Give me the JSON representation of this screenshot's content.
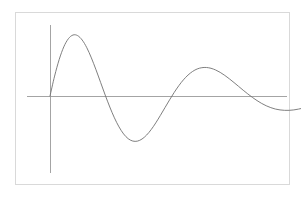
{
  "figure": {
    "width": 301,
    "height": 199,
    "background_color": "#ffffff",
    "border_color": "#d9d9d9",
    "border_rect": {
      "x": 15,
      "y": 12,
      "width": 275,
      "height": 173
    }
  },
  "chart_data": {
    "type": "line",
    "title": "",
    "subtitle": "",
    "xlabel": "",
    "ylabel": "",
    "grid": false,
    "legend": null,
    "series": [
      {
        "name": "damped oscillation",
        "color": "#707070",
        "line_width": 0.9,
        "function": "y = A * exp(-k*x) * sin(2*pi*x/T)",
        "amplitude": 1.0,
        "decay_constant": 0.42,
        "period": 2.0,
        "x_start": 0.0,
        "x_end": 6.95,
        "points": [
          [
            0.0,
            0.0
          ],
          [
            0.1,
            0.296
          ],
          [
            0.2,
            0.543
          ],
          [
            0.3,
            0.731
          ],
          [
            0.4,
            0.852
          ],
          [
            0.5,
            0.907
          ],
          [
            0.6,
            0.898
          ],
          [
            0.7,
            0.832
          ],
          [
            0.8,
            0.718
          ],
          [
            0.9,
            0.566
          ],
          [
            1.0,
            0.39
          ],
          [
            1.1,
            0.202
          ],
          [
            1.2,
            0.014
          ],
          [
            1.3,
            -0.164
          ],
          [
            1.4,
            -0.324
          ],
          [
            1.5,
            -0.459
          ],
          [
            1.6,
            -0.564
          ],
          [
            1.7,
            -0.635
          ],
          [
            1.8,
            -0.67
          ],
          [
            1.9,
            -0.671
          ],
          [
            2.0,
            -0.64
          ],
          [
            2.1,
            -0.581
          ],
          [
            2.2,
            -0.499
          ],
          [
            2.3,
            -0.399
          ],
          [
            2.4,
            -0.288
          ],
          [
            2.5,
            -0.172
          ],
          [
            2.6,
            -0.057
          ],
          [
            2.7,
            0.053
          ],
          [
            2.8,
            0.153
          ],
          [
            2.9,
            0.24
          ],
          [
            3.0,
            0.311
          ],
          [
            3.1,
            0.365
          ],
          [
            3.2,
            0.402
          ],
          [
            3.3,
            0.421
          ],
          [
            3.4,
            0.424
          ],
          [
            3.5,
            0.412
          ],
          [
            3.6,
            0.387
          ],
          [
            3.7,
            0.351
          ],
          [
            3.8,
            0.306
          ],
          [
            3.9,
            0.255
          ],
          [
            4.0,
            0.2
          ],
          [
            4.1,
            0.143
          ],
          [
            4.2,
            0.086
          ],
          [
            4.3,
            0.031
          ],
          [
            4.4,
            -0.021
          ],
          [
            4.5,
            -0.068
          ],
          [
            4.6,
            -0.11
          ],
          [
            4.7,
            -0.145
          ],
          [
            4.8,
            -0.173
          ],
          [
            4.9,
            -0.194
          ],
          [
            5.0,
            -0.207
          ],
          [
            5.1,
            -0.213
          ],
          [
            5.2,
            -0.213
          ],
          [
            5.3,
            -0.207
          ],
          [
            5.4,
            -0.195
          ],
          [
            5.5,
            -0.18
          ],
          [
            5.6,
            -0.161
          ],
          [
            5.7,
            -0.139
          ],
          [
            5.8,
            -0.116
          ],
          [
            5.9,
            -0.092
          ],
          [
            6.0,
            -0.068
          ],
          [
            6.1,
            -0.045
          ],
          [
            6.2,
            -0.023
          ],
          [
            6.3,
            -0.002
          ],
          [
            6.4,
            0.016
          ],
          [
            6.5,
            0.033
          ],
          [
            6.6,
            0.047
          ],
          [
            6.7,
            0.058
          ],
          [
            6.8,
            0.066
          ],
          [
            6.9,
            0.071
          ],
          [
            6.95,
            0.072
          ]
        ],
        "peaks": [
          {
            "index": 1,
            "x_px": 73,
            "y_px": 35
          },
          {
            "index": 2,
            "x_px": 128,
            "y_px": 50
          },
          {
            "index": 3,
            "x_px": 173,
            "y_px": 62
          },
          {
            "index": 4,
            "x_px": 197,
            "y_px": 72
          },
          {
            "index": 5,
            "x_px": 219,
            "y_px": 79
          },
          {
            "index": 6,
            "x_px": 237,
            "y_px": 85
          }
        ],
        "troughs": [
          {
            "index": 1,
            "x_px": 100,
            "y_px": 155
          },
          {
            "index": 2,
            "x_px": 152,
            "y_px": 140
          },
          {
            "index": 3,
            "x_px": 185,
            "y_px": 128
          },
          {
            "index": 4,
            "x_px": 209,
            "y_px": 116
          },
          {
            "index": 5,
            "x_px": 229,
            "y_px": 106
          }
        ]
      }
    ],
    "axes": {
      "color": "#9a9a9a",
      "line_width": 0.9,
      "x_axis": {
        "y_px": 96,
        "x_start_px": 27,
        "x_end_px": 287,
        "ticks": [],
        "tick_labels": []
      },
      "y_axis": {
        "x_px": 50,
        "y_start_px": 25,
        "y_end_px": 173,
        "ticks": [],
        "tick_labels": []
      },
      "origin_px": {
        "x": 50,
        "y": 96
      }
    },
    "plot_area_px": {
      "left": 15,
      "top": 12,
      "right": 290,
      "bottom": 185
    }
  }
}
